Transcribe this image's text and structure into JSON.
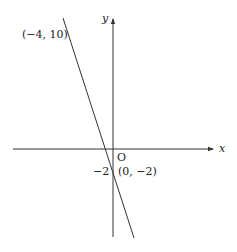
{
  "diagram": {
    "type": "coordinate-plane-line",
    "axes": {
      "x_label": "x",
      "y_label": "y",
      "origin_label": "O"
    },
    "line": {
      "points": [
        {
          "label": "(−4, 10)",
          "x": -4,
          "y": 10
        },
        {
          "label": "(0, −2)",
          "x": 0,
          "y": -2
        }
      ]
    },
    "y_intercept_tick": "−2",
    "colors": {
      "line": "#333333",
      "axis": "#333333",
      "text": "#222222"
    }
  }
}
